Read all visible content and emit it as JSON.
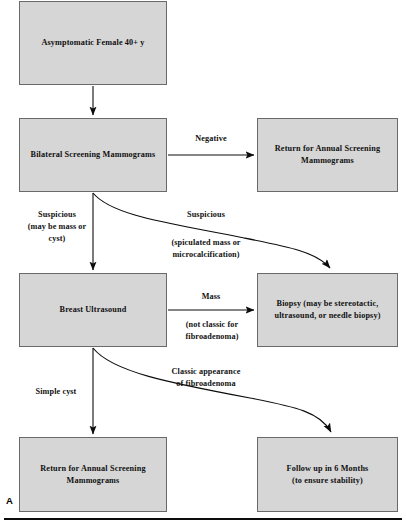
{
  "figure": {
    "panel_letter": "A",
    "box_fill_color": "#d6d6d6",
    "box_border_color": "#6a6a6a",
    "arrow_color": "#0c0c0c"
  },
  "nodes": [
    {
      "id": "asymptomatic-female",
      "text": "Asymptomatic Female  40+ y"
    },
    {
      "id": "bilateral-screening-mammograms",
      "text": "Bilateral Screening Mammograms"
    },
    {
      "id": "return-annual-screening-top",
      "text": "Return for Annual Screening\nMammograms"
    },
    {
      "id": "breast-ultrasound",
      "text": "Breast Ultrasound"
    },
    {
      "id": "biopsy",
      "text": "Biopsy (may be stereotactic,\nultrasound, or needle biopsy)"
    },
    {
      "id": "return-annual-screening-bottom",
      "text": "Return for Annual Screening\nMammograms"
    },
    {
      "id": "follow-up-6-months",
      "text": "Follow up in 6 Months\n(to ensure stability)"
    }
  ],
  "edge_labels": {
    "negative": "Negative",
    "suspicious_left": "Suspicious\n(may be mass or\ncyst)",
    "suspicious_curve_title": "Suspicious",
    "suspicious_curve_detail": "(spiculated mass or\nmicrocalcification)",
    "mass": "Mass",
    "mass_detail": "(not classic for\nfibroadenoma)",
    "simple_cyst": "Simple cyst",
    "classic_fibroadenoma": "Classic appearance\nof fibroadenoma"
  }
}
